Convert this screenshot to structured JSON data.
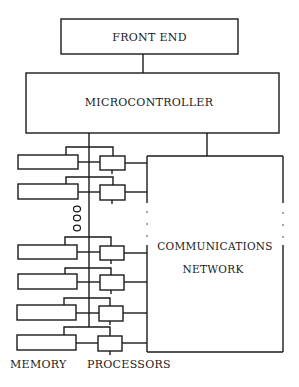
{
  "diagram": {
    "type": "block-diagram",
    "blocks": {
      "front_end": {
        "label": "FRONT END"
      },
      "microcontroller": {
        "label": "MICROCONTROLLER"
      },
      "communications_network": {
        "label_line1": "COMMUNICATIONS",
        "label_line2": "NETWORK"
      }
    },
    "labels": {
      "memory": "MEMORY",
      "processors": "PROCESSORS"
    },
    "memory_processor_pairs": 6,
    "ellipsis_symbol": "ooo",
    "colors": {
      "stroke": "#1a1a1a",
      "background": "#ffffff"
    }
  }
}
